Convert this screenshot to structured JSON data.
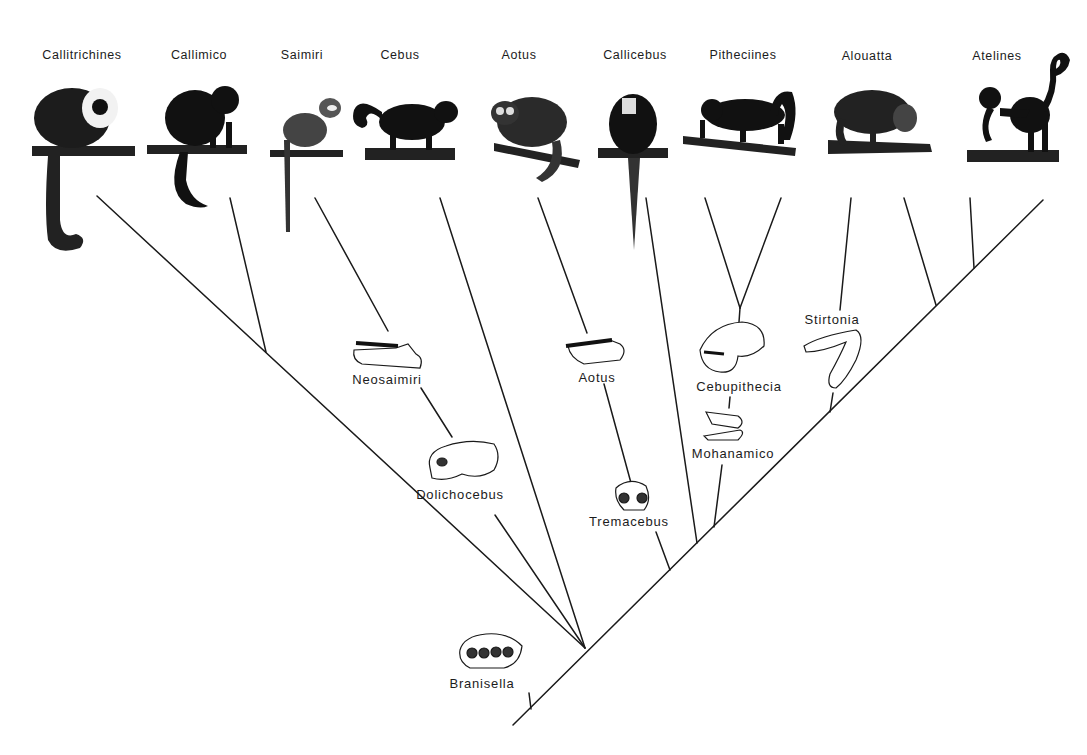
{
  "diagram": {
    "type": "phylogenetic-tree",
    "living_taxa": [
      {
        "id": "callitrichines",
        "label": "Callitrichines",
        "x": 82
      },
      {
        "id": "callimico",
        "label": "Callimico",
        "x": 199
      },
      {
        "id": "saimiri",
        "label": "Saimiri",
        "x": 302
      },
      {
        "id": "cebus",
        "label": "Cebus",
        "x": 400
      },
      {
        "id": "aotus",
        "label": "Aotus",
        "x": 519
      },
      {
        "id": "callicebus",
        "label": "Callicebus",
        "x": 635
      },
      {
        "id": "pitheciines",
        "label": "Pitheciines",
        "x": 743
      },
      {
        "id": "alouatta",
        "label": "Alouatta",
        "x": 867
      },
      {
        "id": "atelines",
        "label": "Atelines",
        "x": 997
      }
    ],
    "fossil_taxa": [
      {
        "id": "neosaimiri",
        "label": "Neosaimiri",
        "x": 387,
        "y": 372,
        "specimen": "lower jaw"
      },
      {
        "id": "dolichocebus",
        "label": "Dolichocebus",
        "x": 460,
        "y": 487,
        "specimen": "skull"
      },
      {
        "id": "aotus-fossil",
        "label": "Aotus",
        "x": 597,
        "y": 370,
        "specimen": "lower jaw"
      },
      {
        "id": "tremacebus",
        "label": "Tremacebus",
        "x": 629,
        "y": 514,
        "specimen": "skull"
      },
      {
        "id": "cebupithecia",
        "label": "Cebupithecia",
        "x": 739,
        "y": 380,
        "specimen": "skull"
      },
      {
        "id": "mohanamico",
        "label": "Mohanamico",
        "x": 733,
        "y": 447,
        "specimen": "jaw"
      },
      {
        "id": "stirtonia",
        "label": "Stirtonia",
        "x": 832,
        "y": 313,
        "specimen": "lower jaw"
      },
      {
        "id": "branisella",
        "label": "Branisella",
        "x": 482,
        "y": 678,
        "specimen": "upper teeth"
      }
    ]
  }
}
